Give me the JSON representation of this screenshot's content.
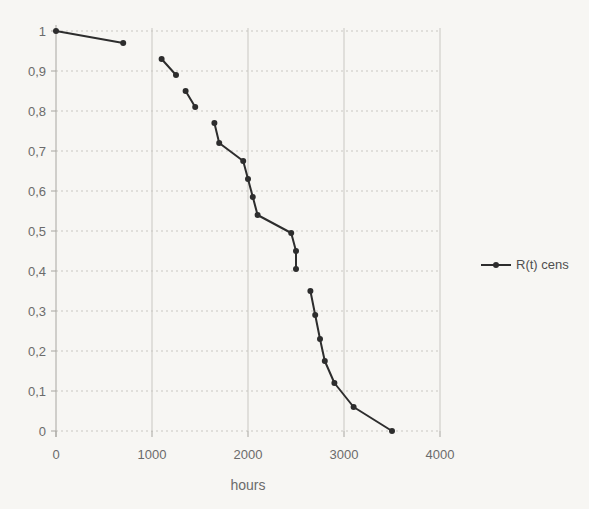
{
  "chart_data": {
    "type": "line",
    "title": "",
    "xlabel": "hours",
    "ylabel": "",
    "legend": {
      "label": "R(t) cens",
      "position": "right"
    },
    "xlim": [
      0,
      4000
    ],
    "ylim": [
      0,
      1
    ],
    "xticks": [
      0,
      1000,
      2000,
      3000,
      4000
    ],
    "xtick_labels": [
      "0",
      "1000",
      "2000",
      "3000",
      "4000"
    ],
    "ytick_values": [
      0,
      0.1,
      0.2,
      0.3,
      0.4,
      0.5,
      0.6,
      0.7,
      0.8,
      0.9,
      1
    ],
    "ytick_labels": [
      "0",
      "0,1",
      "0,2",
      "0,3",
      "0,4",
      "0,5",
      "0,6",
      "0,7",
      "0,8",
      "0,9",
      "1"
    ],
    "grid": true,
    "series": [
      {
        "name": "R(t) cens",
        "marker": "circle",
        "segments": [
          [
            [
              0,
              1.0
            ],
            [
              700,
              0.97
            ]
          ],
          [
            [
              1100,
              0.93
            ],
            [
              1250,
              0.89
            ]
          ],
          [
            [
              1350,
              0.85
            ],
            [
              1450,
              0.81
            ]
          ],
          [
            [
              1650,
              0.77
            ],
            [
              1700,
              0.72
            ],
            [
              1950,
              0.675
            ],
            [
              2000,
              0.63
            ],
            [
              2050,
              0.585
            ],
            [
              2100,
              0.54
            ],
            [
              2450,
              0.495
            ],
            [
              2500,
              0.45
            ],
            [
              2500,
              0.405
            ]
          ],
          [
            [
              2650,
              0.35
            ],
            [
              2700,
              0.29
            ],
            [
              2750,
              0.23
            ],
            [
              2800,
              0.175
            ],
            [
              2900,
              0.12
            ],
            [
              3100,
              0.06
            ],
            [
              3500,
              0.0
            ]
          ]
        ]
      }
    ],
    "colors": {
      "line": "#2d2d2d",
      "grid": "#c9c7c2",
      "axis": "#a8a6a1",
      "text": "#6b6b6b",
      "background": "#f7f6f3"
    }
  }
}
